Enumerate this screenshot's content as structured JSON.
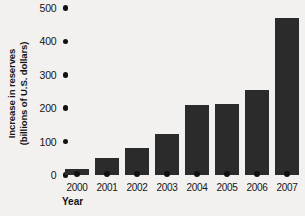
{
  "chart_data": {
    "type": "bar",
    "title": "",
    "xlabel": "Year",
    "ylabel_line1": "Increase in reserves",
    "ylabel_line2": "(billions of U.S. dollars)",
    "categories": [
      "2000",
      "2001",
      "2002",
      "2003",
      "2004",
      "2005",
      "2006",
      "2007"
    ],
    "values": [
      18,
      50,
      80,
      122,
      210,
      213,
      255,
      470
    ],
    "ylim": [
      0,
      500
    ],
    "yticks": [
      0,
      100,
      200,
      300,
      400,
      500
    ],
    "ytick_labels": [
      "0",
      "100",
      "200",
      "300",
      "400",
      "500"
    ],
    "grid": false,
    "legend": null,
    "bar_color": "#2b2b2b",
    "background_color": "#f2f1ef",
    "text_color": "#141414"
  }
}
